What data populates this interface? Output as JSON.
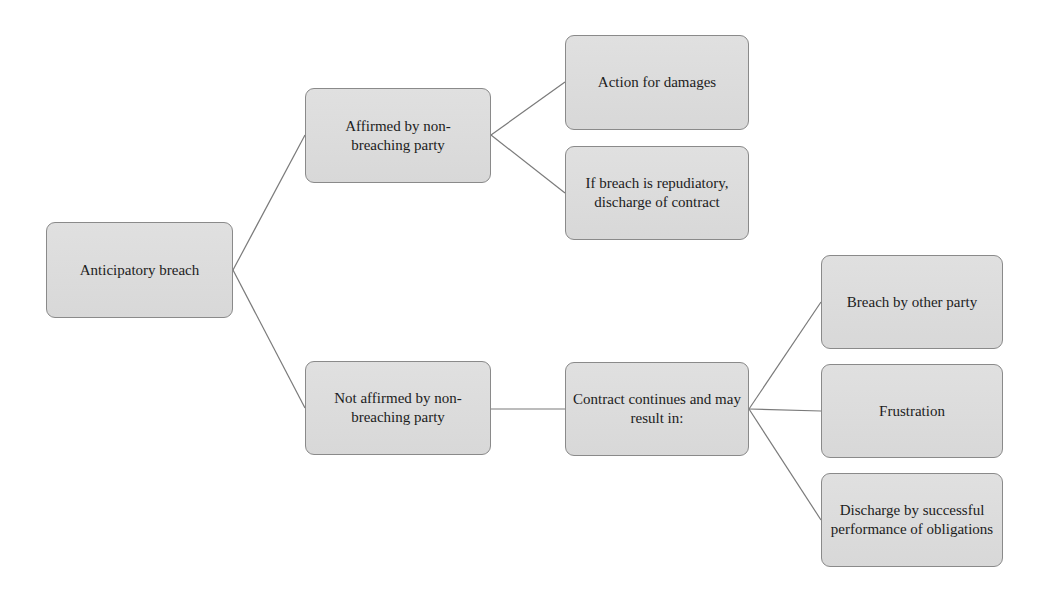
{
  "diagram": {
    "title": "Anticipatory breach",
    "colors": {
      "node_fill": "#dcdcdc",
      "node_border": "#8a8a8a",
      "connector": "#7a7a7a",
      "text": "#1c1c1c",
      "background": "#ffffff"
    },
    "nodes": {
      "root": {
        "label": "Anticipatory breach"
      },
      "affirmed": {
        "label": "Affirmed by non-breaching party"
      },
      "action_damages": {
        "label": "Action for damages"
      },
      "repudiatory_discharge": {
        "label": "If breach is repudiatory, discharge of contract"
      },
      "not_affirmed": {
        "label": "Not affirmed by non-breaching party"
      },
      "contract_continues": {
        "label": "Contract continues and may result in:"
      },
      "breach_other_party": {
        "label": "Breach by other party"
      },
      "frustration": {
        "label": "Frustration"
      },
      "discharge_performance": {
        "label": "Discharge by successful performance of obligations"
      }
    },
    "edges": [
      {
        "from": "root",
        "to": "affirmed"
      },
      {
        "from": "root",
        "to": "not_affirmed"
      },
      {
        "from": "affirmed",
        "to": "action_damages"
      },
      {
        "from": "affirmed",
        "to": "repudiatory_discharge"
      },
      {
        "from": "not_affirmed",
        "to": "contract_continues"
      },
      {
        "from": "contract_continues",
        "to": "breach_other_party"
      },
      {
        "from": "contract_continues",
        "to": "frustration"
      },
      {
        "from": "contract_continues",
        "to": "discharge_performance"
      }
    ]
  }
}
